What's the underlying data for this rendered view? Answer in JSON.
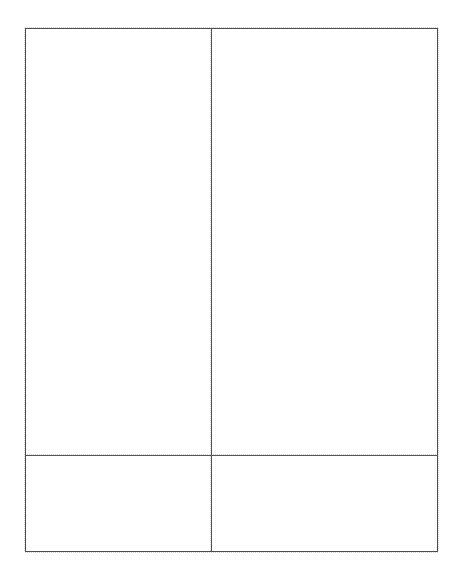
{
  "document": {
    "kind": "empty-form-grid",
    "background_color": "#ffffff",
    "page_width": 467,
    "page_height": 569
  },
  "frame": {
    "border_color": "#4a4a4a",
    "border_width_px": 1,
    "left": 25,
    "top": 28,
    "width": 413,
    "height": 524
  },
  "dividers": {
    "vertical": {
      "x": 211,
      "color": "#4f4f4f",
      "spans_full_height": true
    },
    "horizontal": {
      "y": 455,
      "color": "#555555",
      "spans_full_width": true
    }
  },
  "grid": {
    "rows": [
      {
        "name": "body-row",
        "height": 427,
        "cells": [
          {
            "name": "body-cell-left",
            "text": "",
            "width": 186
          },
          {
            "name": "body-cell-right",
            "text": "",
            "width": 226
          }
        ]
      },
      {
        "name": "footer-row",
        "height": 95,
        "cells": [
          {
            "name": "footer-cell-left",
            "text": "",
            "width": 186
          },
          {
            "name": "footer-cell-right",
            "text": "",
            "width": 226
          }
        ]
      }
    ]
  }
}
